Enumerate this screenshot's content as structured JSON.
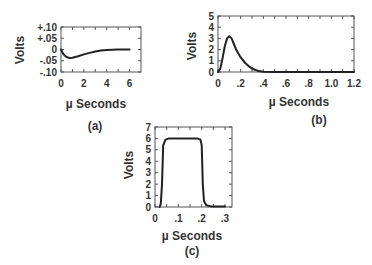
{
  "chart_data": [
    {
      "id": "a",
      "type": "line",
      "caption": "(a)",
      "xlabel": "µ Seconds",
      "ylabel": "Volts",
      "xlim": [
        0,
        7
      ],
      "ylim": [
        -0.1,
        0.1
      ],
      "xticks": [
        "0",
        "2",
        "4",
        "6"
      ],
      "yticks": [
        "+.10",
        "+.05",
        "0",
        "-.05",
        "-.10"
      ],
      "grid": false,
      "series": [
        {
          "name": "signal",
          "x": [
            0,
            0.1,
            0.2,
            0.4,
            0.6,
            0.8,
            1.0,
            1.5,
            2.0,
            2.5,
            3.0,
            3.5,
            4.0,
            4.5,
            5.0,
            5.5,
            6.0
          ],
          "y": [
            0,
            -0.01,
            -0.02,
            -0.03,
            -0.036,
            -0.038,
            -0.037,
            -0.03,
            -0.022,
            -0.015,
            -0.009,
            -0.005,
            -0.002,
            -0.001,
            0,
            0,
            0
          ]
        }
      ]
    },
    {
      "id": "b",
      "type": "line",
      "caption": "(b)",
      "xlabel": "µ Seconds",
      "ylabel": "Volts",
      "xlim": [
        0,
        1.2
      ],
      "ylim": [
        0,
        5
      ],
      "xticks": [
        "0",
        ".2",
        ".4",
        ".6",
        ".8",
        "1.0",
        "1.2"
      ],
      "yticks": [
        "0",
        "1",
        "2",
        "3",
        "4",
        "5"
      ],
      "grid": false,
      "series": [
        {
          "name": "signal",
          "x": [
            0,
            0.02,
            0.04,
            0.06,
            0.08,
            0.1,
            0.12,
            0.14,
            0.16,
            0.2,
            0.24,
            0.28,
            0.32,
            0.36,
            0.4,
            0.5,
            0.6,
            0.8,
            1.0,
            1.2
          ],
          "y": [
            0,
            0.3,
            1.2,
            2.3,
            3.0,
            3.2,
            3.0,
            2.5,
            2.0,
            1.3,
            0.8,
            0.45,
            0.22,
            0.08,
            0.02,
            0,
            0,
            0,
            0,
            0
          ]
        }
      ]
    },
    {
      "id": "c",
      "type": "line",
      "caption": "(c)",
      "xlabel": "µ Seconds",
      "ylabel": "Volts",
      "xlim": [
        0,
        0.33
      ],
      "ylim": [
        0,
        7
      ],
      "xticks": [
        "0",
        ".1",
        ".2",
        ".3"
      ],
      "yticks": [
        "0",
        "1",
        "2",
        "3",
        "4",
        "5",
        "6",
        "7"
      ],
      "grid": false,
      "series": [
        {
          "name": "signal",
          "x": [
            0.02,
            0.025,
            0.03,
            0.035,
            0.045,
            0.06,
            0.18,
            0.195,
            0.2,
            0.205,
            0.21,
            0.22,
            0.24,
            0.3
          ],
          "y": [
            0,
            0.3,
            2.0,
            5.4,
            5.9,
            6.0,
            6.0,
            5.9,
            5.4,
            2.0,
            0.5,
            0.15,
            0.05,
            0.05
          ]
        }
      ]
    }
  ]
}
